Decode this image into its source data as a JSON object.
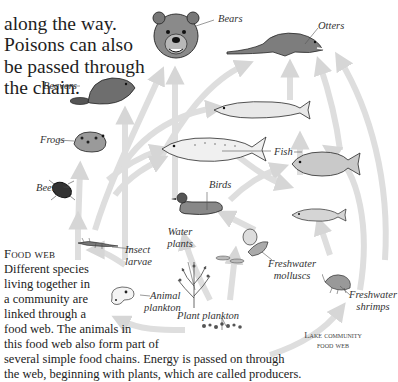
{
  "intro_text": {
    "lines": [
      "along the way.",
      "Poisons can also",
      "be passed through",
      "the chain."
    ]
  },
  "labels": {
    "bears": "Bears",
    "otters": "Otters",
    "beavers": "Beavers",
    "frogs": "Frogs",
    "fish": "Fish",
    "beetles": "Beetles",
    "birds": "Birds",
    "water_plants_1": "Water",
    "water_plants_2": "plants",
    "insect_larvae_1": "Insect",
    "insect_larvae_2": "larvae",
    "freshwater_molluscs_1": "Freshwater",
    "freshwater_molluscs_2": "molluscs",
    "freshwater_shrimps_1": "Freshwater",
    "freshwater_shrimps_2": "shrimps",
    "animal_plankton_1": "Animal",
    "animal_plankton_2": "plankton",
    "plant_plankton": "Plant plankton"
  },
  "caption": {
    "title": "Food web",
    "lines": [
      "Different species",
      "living together in",
      "a community are",
      "linked through a",
      "food web. The animals in",
      "this food web also form part of",
      "several simple food chains. Energy is passed on through",
      "the web, beginning with plants, which are called producers."
    ]
  },
  "diagram_title": {
    "line1": "Lake community",
    "line2": "food web"
  },
  "colors": {
    "arrow": "#d9d9d9",
    "ink": "#2a2a2a",
    "background": "#ffffff"
  }
}
